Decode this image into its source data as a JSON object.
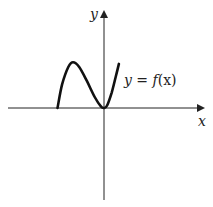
{
  "chart_data": {
    "type": "line",
    "title": "",
    "xlabel": "x",
    "ylabel": "y",
    "annotation": "y = f(x)",
    "curve_label_parts": {
      "lhs": "y",
      "eq": " = ",
      "fn": "f",
      "arg": "(x)"
    },
    "grid": false,
    "xlim": [
      -3,
      3
    ],
    "ylim": [
      -3,
      3
    ],
    "series": [
      {
        "name": "f(x)",
        "points": [
          [
            -1.5,
            0.0
          ],
          [
            -1.35,
            0.75
          ],
          [
            -1.15,
            1.3
          ],
          [
            -1.0,
            1.45
          ],
          [
            -0.8,
            1.3
          ],
          [
            -0.55,
            0.85
          ],
          [
            -0.3,
            0.35
          ],
          [
            -0.1,
            0.05
          ],
          [
            0.0,
            0.0
          ],
          [
            0.1,
            0.08
          ],
          [
            0.25,
            0.5
          ],
          [
            0.38,
            1.0
          ],
          [
            0.48,
            1.4
          ]
        ]
      }
    ]
  }
}
